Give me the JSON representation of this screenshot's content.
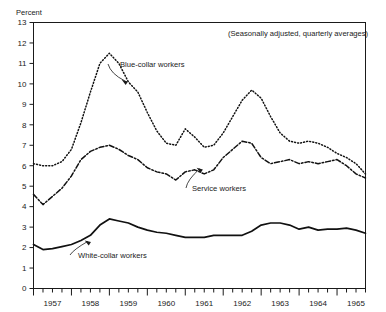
{
  "chart_data": {
    "type": "line",
    "title": "",
    "subtitle": "(Seasonally adjusted, quarterly averages)",
    "ylabel": "Percent",
    "xlabel": "",
    "ylim": [
      0,
      13
    ],
    "yticks": [
      0,
      1,
      2,
      3,
      4,
      5,
      6,
      7,
      8,
      9,
      10,
      11,
      12,
      13
    ],
    "ytick_labels": [
      "0",
      "1",
      "2",
      "3",
      "4",
      "5",
      "6",
      "7",
      "8",
      "9",
      "10",
      "11",
      "12",
      "13"
    ],
    "grid": false,
    "legend_position": "inline-annotations",
    "x_unit": "quarter",
    "xlim_quarters": [
      0,
      35
    ],
    "xtick_year_labels": [
      "1957",
      "1958",
      "1959",
      "1960",
      "1961",
      "1962",
      "1963",
      "1964",
      "1965"
    ],
    "xtick_year_positions_q": [
      2,
      6,
      10,
      14,
      18,
      22,
      26,
      30,
      34
    ],
    "minor_tick_every_quarters": 1,
    "series": [
      {
        "name": "Blue-collar workers",
        "style": "dotted",
        "color": "#111111",
        "x_quarters": [
          0,
          1,
          2,
          3,
          4,
          5,
          6,
          7,
          8,
          9,
          10,
          11,
          12,
          13,
          14,
          15,
          16,
          17,
          18,
          19,
          20,
          21,
          22,
          23,
          24,
          25,
          26,
          27,
          28,
          29,
          30,
          31,
          32,
          33,
          34,
          35
        ],
        "values": [
          6.1,
          6.0,
          6.0,
          6.2,
          6.8,
          8.1,
          9.6,
          11.0,
          11.5,
          11.0,
          10.1,
          9.6,
          8.6,
          7.7,
          7.1,
          7.0,
          7.8,
          7.4,
          6.9,
          7.0,
          7.6,
          8.4,
          9.2,
          9.7,
          9.3,
          8.4,
          7.6,
          7.2,
          7.1,
          7.2,
          7.1,
          6.9,
          6.6,
          6.4,
          6.1,
          5.6
        ],
        "annotation": {
          "label": "Blue-collar workers",
          "point_q": 9.3,
          "point_value": 10.2
        }
      },
      {
        "name": "Service workers",
        "style": "dash-dot",
        "color": "#111111",
        "x_quarters": [
          0,
          1,
          2,
          3,
          4,
          5,
          6,
          7,
          8,
          9,
          10,
          11,
          12,
          13,
          14,
          15,
          16,
          17,
          18,
          19,
          20,
          21,
          22,
          23,
          24,
          25,
          26,
          27,
          28,
          29,
          30,
          31,
          32,
          33,
          34,
          35
        ],
        "values": [
          4.6,
          4.1,
          4.5,
          4.9,
          5.5,
          6.3,
          6.7,
          6.9,
          7.0,
          6.8,
          6.5,
          6.3,
          5.9,
          5.7,
          5.6,
          5.3,
          5.7,
          5.8,
          5.6,
          5.8,
          6.4,
          6.8,
          7.2,
          7.1,
          6.4,
          6.1,
          6.2,
          6.3,
          6.1,
          6.2,
          6.1,
          6.2,
          6.3,
          6.0,
          5.6,
          5.4
        ],
        "annotation": {
          "label": "Service workers",
          "point_q": 17.2,
          "point_value": 5.9
        }
      },
      {
        "name": "White-collar workers",
        "style": "solid",
        "color": "#111111",
        "x_quarters": [
          0,
          1,
          2,
          3,
          4,
          5,
          6,
          7,
          8,
          9,
          10,
          11,
          12,
          13,
          14,
          15,
          16,
          17,
          18,
          19,
          20,
          21,
          22,
          23,
          24,
          25,
          26,
          27,
          28,
          29,
          30,
          31,
          32,
          33,
          34,
          35
        ],
        "values": [
          2.15,
          1.9,
          1.95,
          2.05,
          2.15,
          2.35,
          2.6,
          3.1,
          3.4,
          3.3,
          3.2,
          3.0,
          2.85,
          2.75,
          2.7,
          2.6,
          2.5,
          2.5,
          2.5,
          2.6,
          2.6,
          2.6,
          2.6,
          2.8,
          3.1,
          3.2,
          3.2,
          3.1,
          2.9,
          3.0,
          2.85,
          2.9,
          2.9,
          2.95,
          2.85,
          2.7
        ],
        "annotation": {
          "label": "White-collar workers",
          "point_q": 5.4,
          "point_value": 2.35
        }
      }
    ]
  }
}
